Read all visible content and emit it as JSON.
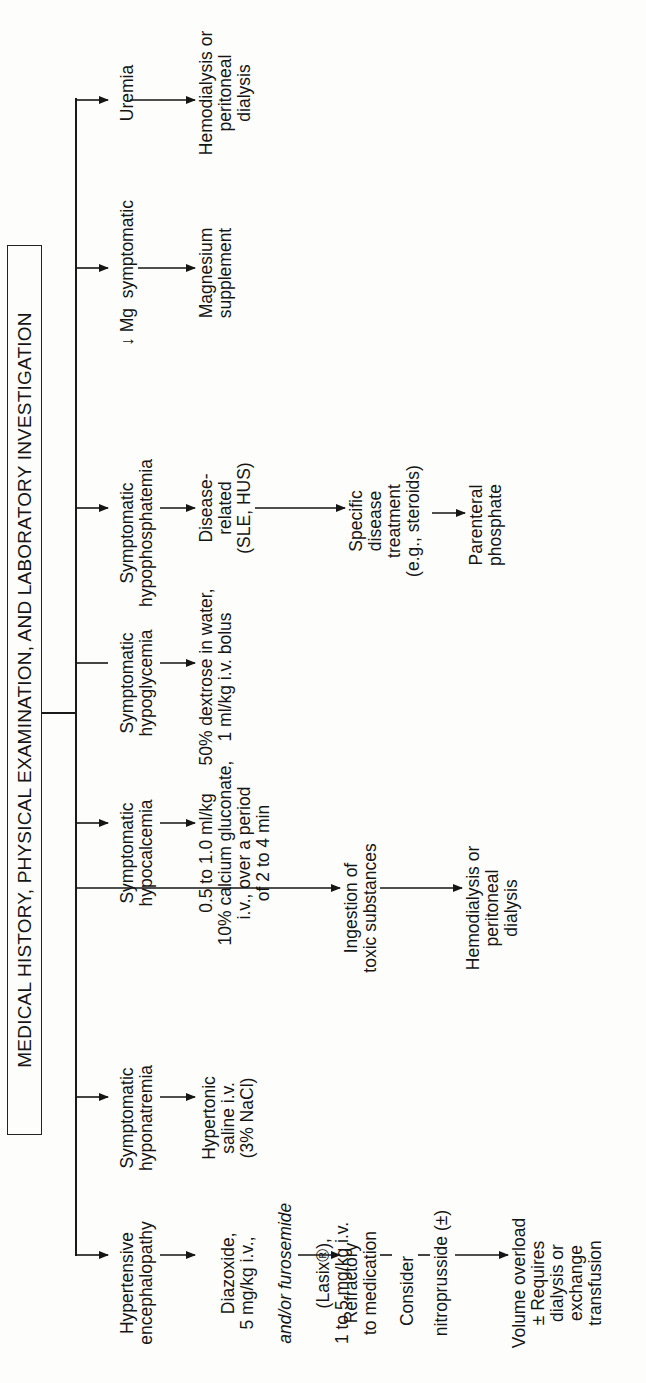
{
  "title": "MEDICAL HISTORY, PHYSICAL EXAMINATION, AND LABORATORY INVESTIGATION",
  "colors": {
    "ink": "#151515",
    "paper": "#fdfdfb"
  },
  "columns": [
    {
      "id": "hypertensive",
      "condition": "Hypertensive\nencephalopathy",
      "steps": [
        {
          "text": "Diazoxide,\n5 mg/kg i.v.,",
          "italic_line": "and/or furosemide",
          "tail": "(Lasix®),\n1 to 5 mg/kg i.v."
        },
        {
          "text": "Refractory\nto medication"
        },
        {
          "text": "Consider"
        },
        {
          "text": "nitroprusside (±)"
        },
        {
          "text": "Volume overload\n± Requires\ndialysis or\nexchange\ntransfusion"
        }
      ]
    },
    {
      "id": "hyponatremia",
      "condition": "Symptomatic\nhyponatremia",
      "steps": [
        {
          "text": "Hypertonic\nsaline i.v.\n(3% NaCl)"
        }
      ]
    },
    {
      "id": "ingestion",
      "condition": "Ingestion of\ntoxic substances",
      "steps": [
        {
          "text": "Hemodialysis or\nperitoneal\ndialysis"
        }
      ]
    },
    {
      "id": "hypocalcemia",
      "condition": "Symptomatic\nhypocalcemia",
      "steps": [
        {
          "text": "0.5 to 1.0 ml/kg\n10% calcium gluconate,\ni.v., over a period\nof 2 to 4 min"
        }
      ]
    },
    {
      "id": "hypoglycemia",
      "condition": "Symptomatic\nhypoglycemia",
      "steps": [
        {
          "text": "50% dextrose in water,\n1 ml/kg i.v. bolus"
        }
      ]
    },
    {
      "id": "hypophosphatemia",
      "condition": "Symptomatic\nhypophosphatemia",
      "steps": [
        {
          "text": "Disease-\nrelated\n(SLE, HUS)"
        },
        {
          "text": "Specific\ndisease\ntreatment\n(e.g., steroids)"
        },
        {
          "text": "Parenteral\nphosphate"
        }
      ]
    },
    {
      "id": "magnesium",
      "condition": "↓ Mg  symptomatic",
      "steps": [
        {
          "text": "Magnesium\nsupplement"
        }
      ]
    },
    {
      "id": "uremia",
      "condition": "Uremia",
      "steps": [
        {
          "text": "Hemodialysis or\nperitoneal\ndialysis"
        }
      ]
    }
  ]
}
